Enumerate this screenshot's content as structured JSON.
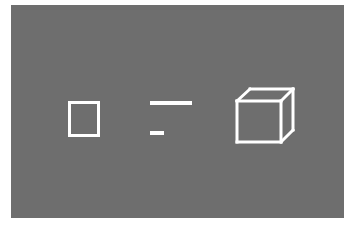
{
  "canvas": {
    "width": 355,
    "height": 227,
    "background_color": "#ffffff",
    "panel_color": "#6e6e6e",
    "stroke_color": "#ffffff"
  },
  "panel": {
    "x": 11,
    "y": 5,
    "width": 333,
    "height": 213
  },
  "figures": [
    {
      "id": "square",
      "name": "outlined-square",
      "type": "rectangle",
      "x": 68,
      "y": 101,
      "width": 32,
      "height": 36,
      "stroke_width": 3,
      "stroke_color": "#ffffff"
    },
    {
      "id": "long-line",
      "name": "long-horizontal-line",
      "type": "line",
      "x1": 150,
      "y1": 103,
      "x2": 192,
      "y2": 103,
      "length": 42,
      "stroke_width": 4,
      "stroke_color": "#ffffff"
    },
    {
      "id": "short-line",
      "name": "short-horizontal-line",
      "type": "line",
      "x1": 150,
      "y1": 133,
      "x2": 164,
      "y2": 133,
      "length": 14,
      "stroke_width": 4,
      "stroke_color": "#ffffff"
    },
    {
      "id": "cube",
      "name": "wireframe-cube",
      "type": "cube-wireframe",
      "projection": "oblique",
      "stroke_width": 3,
      "stroke_color": "#ffffff",
      "vertices": {
        "front_top_left": [
          237,
          101
        ],
        "front_top_right": [
          281,
          101
        ],
        "front_bottom_right": [
          281,
          142
        ],
        "front_bottom_left": [
          237,
          142
        ],
        "back_top_left": [
          250,
          89
        ],
        "back_top_right": [
          293,
          89
        ],
        "back_bottom_right": [
          293,
          130
        ],
        "back_bottom_left": [
          250,
          118
        ]
      },
      "edges": [
        [
          "front_top_left",
          "front_top_right"
        ],
        [
          "front_top_right",
          "front_bottom_right"
        ],
        [
          "front_bottom_right",
          "front_bottom_left"
        ],
        [
          "front_bottom_left",
          "front_top_left"
        ],
        [
          "back_top_left",
          "back_top_right"
        ],
        [
          "back_top_right",
          "back_bottom_right"
        ],
        [
          "front_top_left",
          "back_top_left"
        ],
        [
          "front_top_right",
          "back_top_right"
        ],
        [
          "front_bottom_right",
          "back_bottom_right"
        ]
      ]
    }
  ]
}
